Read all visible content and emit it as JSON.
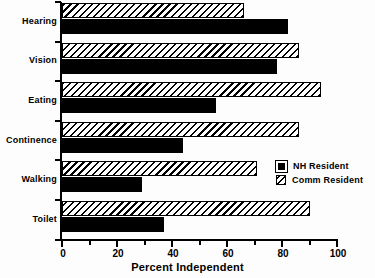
{
  "chart_data": {
    "type": "bar",
    "orientation": "horizontal",
    "title": "",
    "xlabel": "Percent Independent",
    "ylabel": "",
    "xlim": [
      0,
      100
    ],
    "xticks": [
      0,
      20,
      40,
      60,
      80,
      100
    ],
    "xtick_labels": [
      "0",
      "20",
      "40",
      "60",
      "80",
      "100"
    ],
    "minor_tick_interval": 10,
    "grid": false,
    "legend_position": "center-right",
    "categories": [
      "Hearing",
      "Vision",
      "Eating",
      "Continence",
      "Walking",
      "Toilet"
    ],
    "series": [
      {
        "name": "NH Resident",
        "style": "solid-black",
        "color": "#000000",
        "values": [
          82,
          78,
          56,
          44,
          29,
          37
        ]
      },
      {
        "name": "Comm Resident",
        "style": "diagonal-hatch",
        "color": "#ffffff",
        "values": [
          66,
          86,
          94,
          86,
          71,
          90
        ]
      }
    ]
  },
  "legend": {
    "entries": [
      {
        "label": "NH Resident",
        "swatch": "solid-black-swatch"
      },
      {
        "label": "Comm Resident",
        "swatch": "hatched-swatch"
      }
    ]
  },
  "axis": {
    "x_title": "Percent Independent"
  }
}
